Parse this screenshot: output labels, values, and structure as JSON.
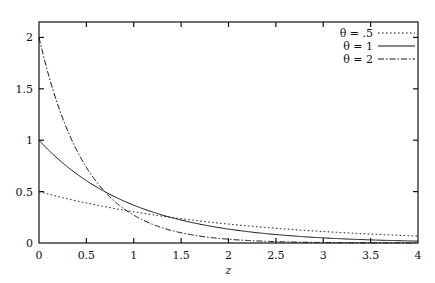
{
  "figure": {
    "background": "#ffffff",
    "ink_color": "#111111",
    "frame": {
      "left": 39,
      "right": 418,
      "top": 22,
      "bottom": 243
    }
  },
  "chart_data": {
    "type": "line",
    "title": "",
    "xlabel": "z",
    "ylabel": "",
    "xlim": [
      0,
      4
    ],
    "ylim": [
      0,
      2.15
    ],
    "grid": false,
    "legend_position": "top-right",
    "xticks": [
      0,
      0.5,
      1,
      1.5,
      2,
      2.5,
      3,
      3.5,
      4
    ],
    "xticklabels": [
      "0",
      "0.5",
      "1",
      "1.5",
      "2",
      "2.5",
      "3",
      "3.5",
      "4"
    ],
    "yticks": [
      0,
      0.5,
      1,
      1.5,
      2
    ],
    "yticklabels": [
      "0",
      "0.5",
      "1",
      "1.5",
      "2"
    ],
    "function": "f(z) = theta * exp(-theta * z)",
    "series": [
      {
        "name": "theta = .5",
        "legend_label": "θ = .5",
        "theta": 0.5,
        "style": "dotted",
        "dasharray": "1.6,2.4",
        "width": 1,
        "color": "#111111",
        "x": [
          0,
          0.1,
          0.2,
          0.3,
          0.4,
          0.5,
          0.6,
          0.7,
          0.8,
          0.9,
          1,
          1.2,
          1.4,
          1.6,
          1.8,
          2,
          2.25,
          2.5,
          2.75,
          3,
          3.25,
          3.5,
          3.75,
          4
        ],
        "values": [
          0.5,
          0.4756,
          0.4524,
          0.4303,
          0.4093,
          0.3894,
          0.3704,
          0.3523,
          0.3351,
          0.3188,
          0.3033,
          0.2744,
          0.2483,
          0.2247,
          0.2033,
          0.1839,
          0.1622,
          0.1432,
          0.1263,
          0.1115,
          0.0984,
          0.0868,
          0.0766,
          0.0677
        ]
      },
      {
        "name": "theta = 1",
        "legend_label": "θ = 1",
        "theta": 1,
        "style": "solid",
        "dasharray": "",
        "width": 1,
        "color": "#111111",
        "x": [
          0,
          0.1,
          0.2,
          0.3,
          0.4,
          0.5,
          0.6,
          0.7,
          0.8,
          0.9,
          1,
          1.2,
          1.4,
          1.6,
          1.8,
          2,
          2.25,
          2.5,
          2.75,
          3,
          3.25,
          3.5,
          3.75,
          4
        ],
        "values": [
          1,
          0.9048,
          0.8187,
          0.7408,
          0.6703,
          0.6065,
          0.5488,
          0.4966,
          0.4493,
          0.4066,
          0.3679,
          0.3012,
          0.2466,
          0.2019,
          0.1653,
          0.1353,
          0.1054,
          0.0821,
          0.0639,
          0.0498,
          0.0388,
          0.0302,
          0.0235,
          0.0183
        ]
      },
      {
        "name": "theta = 2",
        "legend_label": "θ = 2",
        "theta": 2,
        "style": "dashdot",
        "dasharray": "6,2,1.5,2",
        "width": 1,
        "color": "#111111",
        "x": [
          0,
          0.1,
          0.2,
          0.3,
          0.4,
          0.5,
          0.6,
          0.7,
          0.8,
          0.9,
          1,
          1.2,
          1.4,
          1.6,
          1.8,
          2,
          2.25,
          2.5,
          2.75,
          3,
          3.25,
          3.5,
          3.75,
          4
        ],
        "values": [
          2,
          1.6375,
          1.3406,
          1.0976,
          0.8987,
          0.7358,
          0.6024,
          0.4932,
          0.4038,
          0.3306,
          0.2707,
          0.1814,
          0.1216,
          0.0815,
          0.0546,
          0.0366,
          0.0222,
          0.0135,
          0.0082,
          0.005,
          0.003,
          0.0018,
          0.0011,
          0.0007
        ]
      }
    ],
    "annotations": []
  }
}
